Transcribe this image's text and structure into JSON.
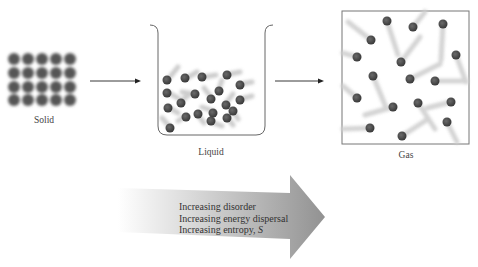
{
  "diagram": {
    "phases": [
      {
        "id": "solid",
        "label": "Solid"
      },
      {
        "id": "liquid",
        "label": "Liquid"
      },
      {
        "id": "gas",
        "label": "Gas"
      }
    ],
    "arrows": [
      {
        "from": "solid",
        "to": "liquid"
      },
      {
        "from": "liquid",
        "to": "gas"
      }
    ],
    "big_arrow": {
      "lines": [
        "Increasing disorder",
        "Increasing energy dispersal",
        "Increasing entropy, "
      ],
      "entropy_symbol": "S"
    },
    "colors": {
      "particle": "#4a4a4a",
      "container": "#666666",
      "big_arrow_dark": "#8a8a8a",
      "big_arrow_light": "#ffffff"
    }
  }
}
